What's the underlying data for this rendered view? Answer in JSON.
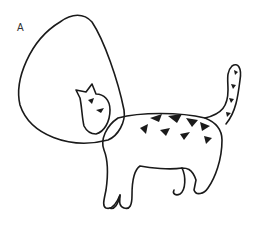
{
  "figure": {
    "panel_label": "A",
    "style": "black line drawing on white",
    "colors": {
      "ink": "#1a1a1a",
      "background": "#ffffff"
    }
  }
}
